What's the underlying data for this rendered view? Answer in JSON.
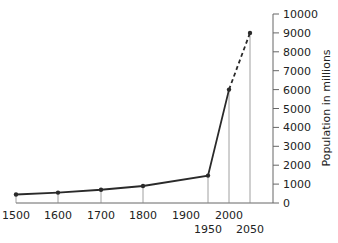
{
  "chart_data": {
    "type": "line",
    "title": "",
    "xlabel": "",
    "ylabel": "Population in millions",
    "x": [
      1500,
      1600,
      1700,
      1800,
      1950,
      2000,
      2050
    ],
    "series": [
      {
        "name": "Population (actual)",
        "style": "solid",
        "x": [
          1500,
          1600,
          1700,
          1800,
          1950,
          2000
        ],
        "values": [
          450,
          550,
          700,
          900,
          1450,
          6000
        ]
      },
      {
        "name": "Population (projected)",
        "style": "dashed",
        "x": [
          2000,
          2050
        ],
        "values": [
          6000,
          9000
        ]
      }
    ],
    "x_tick_labels": [
      "1500",
      "1600",
      "1700",
      "1800",
      "1900",
      "1950",
      "2000",
      "2050"
    ],
    "y_ticks": [
      0,
      1000,
      2000,
      3000,
      4000,
      5000,
      6000,
      7000,
      8000,
      9000,
      10000
    ],
    "y_tick_labels": [
      "0",
      "1000",
      "2000",
      "3000",
      "4000",
      "5000",
      "6000",
      "7000",
      "8000",
      "9000",
      "10000"
    ],
    "ylim": [
      0,
      10000
    ],
    "xlim": [
      1500,
      2090
    ],
    "grid": false,
    "legend": "none",
    "y_axis_position": "right",
    "colors": {
      "line": "#2a2a2a",
      "axis": "#666666",
      "drop_lines": "#888888"
    }
  }
}
